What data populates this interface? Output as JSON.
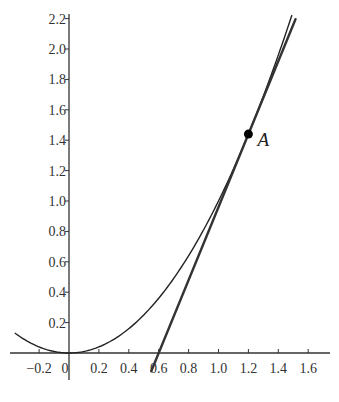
{
  "chart_data": {
    "type": "line",
    "title": "",
    "xlabel": "",
    "ylabel": "",
    "xlim": [
      -0.36,
      1.8
    ],
    "ylim": [
      -0.13,
      2.22
    ],
    "grid": false,
    "legend": null,
    "x_ticks": [
      {
        "value": -0.2,
        "label": "−0.2"
      },
      {
        "value": 0,
        "label": "0"
      },
      {
        "value": 0.2,
        "label": "0.2"
      },
      {
        "value": 0.4,
        "label": "0.4"
      },
      {
        "value": 0.6,
        "label": "0.6"
      },
      {
        "value": 0.8,
        "label": "0.8"
      },
      {
        "value": 1.0,
        "label": "1.0"
      },
      {
        "value": 1.2,
        "label": "1.2"
      },
      {
        "value": 1.4,
        "label": "1.4"
      },
      {
        "value": 1.6,
        "label": "1.6"
      }
    ],
    "y_ticks": [
      {
        "value": 0.2,
        "label": "0.2"
      },
      {
        "value": 0.4,
        "label": "0.4"
      },
      {
        "value": 0.6,
        "label": "0.6"
      },
      {
        "value": 0.8,
        "label": "0.8"
      },
      {
        "value": 1.0,
        "label": "1.0"
      },
      {
        "value": 1.2,
        "label": "1.2"
      },
      {
        "value": 1.4,
        "label": "1.4"
      },
      {
        "value": 1.6,
        "label": "1.6"
      },
      {
        "value": 1.8,
        "label": "1.8"
      },
      {
        "value": 2.0,
        "label": "2.0"
      },
      {
        "value": 2.2,
        "label": "2.2"
      }
    ],
    "series": [
      {
        "name": "parabola",
        "kind": "curve",
        "equation": "y = x^2",
        "x_range": [
          -0.36,
          1.49
        ],
        "stroke": "#222222",
        "width": 1.4
      },
      {
        "name": "tangent",
        "kind": "line",
        "equation": "y = 2.4x - 1.44",
        "x_range": [
          0.55,
          1.515
        ],
        "stroke": "#333333",
        "width": 2.4
      }
    ],
    "annotations": [
      {
        "type": "point",
        "label": "A",
        "x": 1.2,
        "y": 1.44,
        "color": "#000000"
      }
    ],
    "origin_label": "0"
  }
}
